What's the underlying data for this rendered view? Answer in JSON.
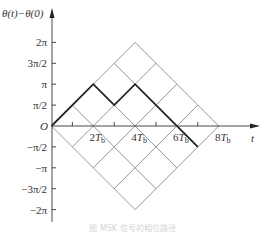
{
  "figure": {
    "y_axis_label": "θ(t)−θ(0)",
    "x_axis_label": "t",
    "origin_label": "O",
    "y_ticks": [
      {
        "label": "2π",
        "value": 2.0
      },
      {
        "label": "3π/2",
        "value": 1.5
      },
      {
        "label": "π",
        "value": 1.0
      },
      {
        "label": "π/2",
        "value": 0.5
      },
      {
        "label": "−π/2",
        "value": -0.5
      },
      {
        "label": "−π",
        "value": -1.0
      },
      {
        "label": "−3π/2",
        "value": -1.5
      },
      {
        "label": "−2π",
        "value": -2.0
      }
    ],
    "x_ticks": [
      {
        "label": "2T",
        "sub": "b",
        "value": 2
      },
      {
        "label": "4T",
        "sub": "b",
        "value": 4
      },
      {
        "label": "6T",
        "sub": "b",
        "value": 6
      },
      {
        "label": "8T",
        "sub": "b",
        "value": 8
      }
    ],
    "minor_x_ticks": [
      1,
      3,
      5,
      7
    ],
    "caption": "图 MSK 信号的相位路径",
    "colors": {
      "grid": "#8a8a8a",
      "path": "#222222",
      "axis": "#333333"
    }
  },
  "chart_data": {
    "type": "line",
    "title": "",
    "xlabel": "t (in units of T_b)",
    "ylabel": "θ(t)−θ(0) (in units of π)",
    "xlim": [
      0,
      8
    ],
    "ylim": [
      -2,
      2
    ],
    "grid": "phase-lattice diamond, slopes ±π/(2T_b)",
    "lattice_vertices": {
      "left": [
        0,
        0
      ],
      "top": [
        4,
        2
      ],
      "right": [
        8,
        0
      ],
      "bottom": [
        4,
        -2
      ]
    },
    "series": [
      {
        "name": "phase path (bold)",
        "x": [
          0,
          2,
          3,
          4,
          7
        ],
        "y": [
          0,
          1,
          0.5,
          1,
          -0.5
        ]
      }
    ]
  }
}
